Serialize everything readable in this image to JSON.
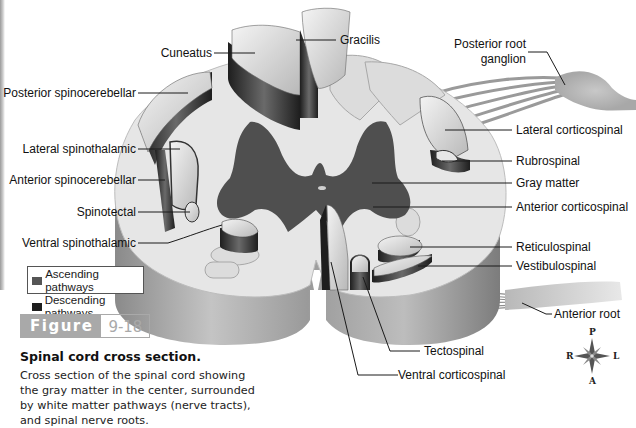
{
  "figure": {
    "tag_word": "Figure",
    "tag_number": "9-18",
    "caption_title": "Spinal cord cross section.",
    "caption_body": "Cross section of the spinal cord showing the gray matter in the center, surrounded by white matter pathways (nerve tracts), and spinal nerve roots."
  },
  "legend": {
    "items": [
      {
        "label": "Ascending pathways",
        "color": "#555555"
      },
      {
        "label": "Descending pathways",
        "color": "#1e1e1e"
      }
    ]
  },
  "labels": {
    "left": [
      {
        "id": "cuneatus",
        "text": "Cuneatus"
      },
      {
        "id": "posterior-spinocerebellar",
        "text": "Posterior spinocerebellar"
      },
      {
        "id": "lateral-spinothalamic",
        "text": "Lateral spinothalamic"
      },
      {
        "id": "anterior-spinocerebellar",
        "text": "Anterior spinocerebellar"
      },
      {
        "id": "spinotectal",
        "text": "Spinotectal"
      },
      {
        "id": "ventral-spinothalamic",
        "text": "Ventral spinothalamic"
      }
    ],
    "right": [
      {
        "id": "gracilis",
        "text": "Gracilis"
      },
      {
        "id": "posterior-root-ganglion",
        "text": "Posterior root ganglion",
        "line1": "Posterior root",
        "line2": "ganglion"
      },
      {
        "id": "lateral-corticospinal",
        "text": "Lateral corticospinal"
      },
      {
        "id": "rubrospinal",
        "text": "Rubrospinal"
      },
      {
        "id": "gray-matter",
        "text": "Gray matter"
      },
      {
        "id": "anterior-corticospinal",
        "text": "Anterior corticospinal"
      },
      {
        "id": "reticulospinal",
        "text": "Reticulospinal"
      },
      {
        "id": "vestibulospinal",
        "text": "Vestibulospinal"
      },
      {
        "id": "anterior-root",
        "text": "Anterior root"
      },
      {
        "id": "tectospinal",
        "text": "Tectospinal"
      },
      {
        "id": "ventral-corticospinal",
        "text": "Ventral corticospinal"
      }
    ]
  },
  "compass": {
    "top": "P",
    "bottom": "A",
    "left": "R",
    "right": "L"
  },
  "colors": {
    "white_matter": "#e6e6e6",
    "gray_matter": "#4f4f4f",
    "tract_light": "#d4d4d4",
    "tract_side_dark": "#2a2a2a",
    "cylinder_side": "#a8a8a8",
    "figure_tag": "#a9a9a9"
  }
}
